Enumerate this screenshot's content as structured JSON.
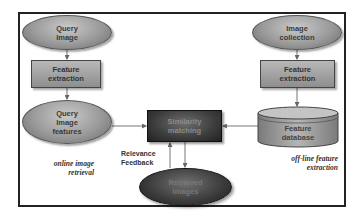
{
  "diagram": {
    "nodes": {
      "query_image": "Query Image",
      "feature_extraction_left": "Feature extraction",
      "query_image_features": "Query Image features",
      "similarity_matching": "Similarity matching",
      "retrieved_images": "Retrieved Images",
      "image_collection": "Image collection",
      "feature_extraction_right": "Feature extraction",
      "feature_database": "Feature database"
    },
    "labels": {
      "online": "online image retrieval",
      "offline": "off-line feature extraction",
      "relevance_feedback": "Relevance Feedback"
    },
    "edges": [
      [
        "Query Image",
        "Feature extraction"
      ],
      [
        "Feature extraction",
        "Query Image features"
      ],
      [
        "Query Image features",
        "Similarity matching"
      ],
      [
        "Image collection",
        "Feature extraction"
      ],
      [
        "Feature extraction",
        "Feature database"
      ],
      [
        "Feature database",
        "Similarity matching"
      ],
      [
        "Similarity matching",
        "Retrieved Images"
      ],
      [
        "Retrieved Images",
        "Similarity matching"
      ]
    ]
  }
}
